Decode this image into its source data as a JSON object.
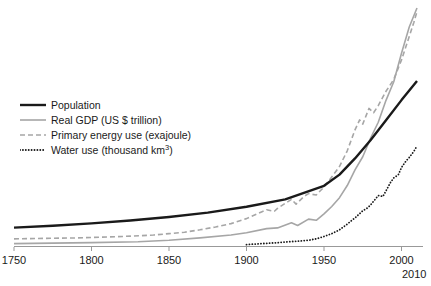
{
  "chart_data": {
    "type": "line",
    "title": "",
    "subtitle": "",
    "xlabel": "",
    "ylabel": "",
    "xlim": [
      1750,
      2010
    ],
    "ylim": [
      0,
      1
    ],
    "grid": false,
    "legend_position": "upper-left",
    "xticks": [
      {
        "value": 1750,
        "label": "1750"
      },
      {
        "value": 1800,
        "label": "1800"
      },
      {
        "value": 1850,
        "label": "1850"
      },
      {
        "value": 1900,
        "label": "1900"
      },
      {
        "value": 1950,
        "label": "1950"
      },
      {
        "value": 2000,
        "label": "2000"
      }
    ],
    "extra_xlabel": "2010",
    "yticks": [],
    "series": [
      {
        "name": "Population",
        "label": "Population",
        "unit": "",
        "color": "#1a1a1a",
        "style": "solid",
        "width": 2.4,
        "x": [
          1750,
          1775,
          1800,
          1825,
          1850,
          1875,
          1900,
          1925,
          1950,
          1960,
          1970,
          1980,
          1990,
          2000,
          2010
        ],
        "values": [
          0.077,
          0.085,
          0.095,
          0.107,
          0.122,
          0.14,
          0.165,
          0.196,
          0.253,
          0.3,
          0.368,
          0.444,
          0.528,
          0.613,
          0.693
        ]
      },
      {
        "name": "Real GDP (US $ trillion)",
        "label": "Real GDP (US $ trillion)",
        "unit": "US $ trillion",
        "color": "#a6a6a6",
        "style": "solid",
        "width": 1.6,
        "x": [
          1750,
          1800,
          1830,
          1850,
          1870,
          1890,
          1900,
          1913,
          1920,
          1929,
          1933,
          1940,
          1945,
          1950,
          1955,
          1960,
          1965,
          1970,
          1975,
          1980,
          1985,
          1990,
          1995,
          2000,
          2005,
          2010
        ],
        "values": [
          0.01,
          0.014,
          0.018,
          0.024,
          0.034,
          0.046,
          0.056,
          0.073,
          0.076,
          0.098,
          0.086,
          0.113,
          0.108,
          0.135,
          0.166,
          0.203,
          0.254,
          0.32,
          0.375,
          0.452,
          0.52,
          0.612,
          0.69,
          0.81,
          0.92,
          1.0
        ]
      },
      {
        "name": "Primary energy use (exajoule)",
        "label": "Primary energy use (exajoule)",
        "unit": "exajoule",
        "color": "#a6a6a6",
        "style": "dashed",
        "width": 1.6,
        "x": [
          1750,
          1790,
          1820,
          1840,
          1850,
          1860,
          1870,
          1880,
          1890,
          1900,
          1910,
          1913,
          1918,
          1920,
          1929,
          1932,
          1937,
          1940,
          1945,
          1950,
          1955,
          1960,
          1965,
          1970,
          1973,
          1975,
          1979,
          1982,
          1985,
          1990,
          1995,
          2000,
          2005,
          2008,
          2010
        ],
        "values": [
          0.03,
          0.034,
          0.04,
          0.046,
          0.052,
          0.058,
          0.068,
          0.08,
          0.094,
          0.115,
          0.144,
          0.152,
          0.146,
          0.158,
          0.196,
          0.176,
          0.208,
          0.22,
          0.214,
          0.248,
          0.29,
          0.334,
          0.4,
          0.488,
          0.53,
          0.512,
          0.578,
          0.56,
          0.59,
          0.65,
          0.7,
          0.782,
          0.88,
          0.94,
          0.985
        ]
      },
      {
        "name": "Water use (thousand km3)",
        "label": "Water use (thousand km³)",
        "unit": "thousand km³",
        "color": "#1a1a1a",
        "style": "dotted",
        "width": 1.8,
        "x": [
          1900,
          1910,
          1920,
          1930,
          1940,
          1945,
          1950,
          1955,
          1960,
          1965,
          1968,
          1970,
          1975,
          1978,
          1980,
          1983,
          1985,
          1988,
          1990,
          1993,
          1995,
          1998,
          2000,
          2003,
          2005,
          2008,
          2010
        ],
        "values": [
          0.006,
          0.01,
          0.014,
          0.019,
          0.024,
          0.03,
          0.04,
          0.052,
          0.068,
          0.092,
          0.108,
          0.118,
          0.148,
          0.16,
          0.172,
          0.196,
          0.212,
          0.208,
          0.232,
          0.268,
          0.286,
          0.3,
          0.33,
          0.358,
          0.372,
          0.398,
          0.42
        ]
      }
    ]
  },
  "legend": {
    "items": [
      {
        "label": "Population",
        "style": "solid",
        "color": "#1a1a1a",
        "width": 2.4
      },
      {
        "label": "Real GDP (US $ trillion)",
        "style": "solid",
        "color": "#a6a6a6",
        "width": 1.6
      },
      {
        "label": "Primary energy use (exajoule)",
        "style": "dashed",
        "color": "#a6a6a6",
        "width": 1.6
      },
      {
        "label": "Water use (thousand km",
        "style": "dotted",
        "color": "#1a1a1a",
        "width": 1.8,
        "sup": "3",
        "suffix": ")"
      }
    ]
  },
  "axis": {
    "line_color": "#999999"
  }
}
